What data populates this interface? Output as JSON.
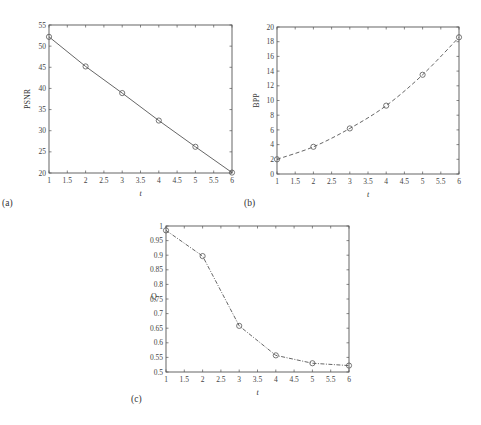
{
  "chart_data": [
    {
      "panel": "(a)",
      "type": "line",
      "title": "",
      "xlabel": "t",
      "ylabel": "PSNR",
      "xlim": [
        1,
        6
      ],
      "ylim": [
        20,
        55
      ],
      "xticks": [
        "1",
        "1.5",
        "2",
        "2.5",
        "3",
        "3.5",
        "4",
        "4.5",
        "5",
        "5.5",
        "6"
      ],
      "yticks": [
        "20",
        "25",
        "30",
        "35",
        "40",
        "45",
        "50",
        "55"
      ],
      "grid": false,
      "legend": null,
      "line_style": "solid",
      "marker": "circle",
      "x": [
        1,
        2,
        3,
        4,
        5,
        6
      ],
      "values": [
        52.2,
        45.2,
        38.9,
        32.4,
        26.2,
        20.1
      ]
    },
    {
      "panel": "(b)",
      "type": "line",
      "title": "",
      "xlabel": "t",
      "ylabel": "BPP",
      "xlim": [
        1,
        6
      ],
      "ylim": [
        0,
        20
      ],
      "xticks": [
        "1",
        "1.5",
        "2",
        "2.5",
        "3",
        "3.5",
        "4",
        "4.5",
        "5",
        "5.5",
        "6"
      ],
      "yticks": [
        "0",
        "2",
        "4",
        "6",
        "8",
        "10",
        "12",
        "14",
        "16",
        "18",
        "20"
      ],
      "grid": false,
      "legend": null,
      "line_style": "dashed",
      "marker": "circle",
      "x": [
        1,
        2,
        3,
        4,
        5,
        6
      ],
      "values": [
        2.0,
        3.7,
        6.2,
        9.3,
        13.5,
        18.6
      ]
    },
    {
      "panel": "(c)",
      "type": "line",
      "title": "",
      "xlabel": "t",
      "ylabel": "Q",
      "xlim": [
        1,
        6
      ],
      "ylim": [
        0.5,
        1
      ],
      "xticks": [
        "1",
        "1.5",
        "2",
        "2.5",
        "3",
        "3.5",
        "4",
        "4.5",
        "5",
        "5.5",
        "6"
      ],
      "yticks": [
        "0.5",
        "0.55",
        "0.6",
        "0.65",
        "0.7",
        "0.75",
        "0.8",
        "0.85",
        "0.9",
        "0.95",
        "1"
      ],
      "grid": false,
      "legend": null,
      "line_style": "dash-dot",
      "marker": "circle",
      "x": [
        1,
        2,
        3,
        4,
        5,
        6
      ],
      "values": [
        0.985,
        0.897,
        0.658,
        0.557,
        0.53,
        0.522
      ]
    }
  ],
  "colors": {
    "axis": "#555555",
    "line": "#555555",
    "text": "#333333"
  }
}
